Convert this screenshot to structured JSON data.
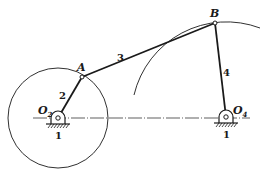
{
  "diagram": {
    "type": "four-bar linkage",
    "colors": {
      "ink": "#1a1a1a",
      "background": "#ffffff"
    },
    "points": {
      "O2": {
        "label": "O",
        "subscript": "2",
        "x": 58,
        "y": 118
      },
      "A": {
        "label": "A",
        "x": 82,
        "y": 77
      },
      "B": {
        "label": "B",
        "x": 215,
        "y": 23
      },
      "O4": {
        "label": "O",
        "subscript": "4",
        "x": 226,
        "y": 117
      }
    },
    "links": [
      {
        "id": "2",
        "label": "2",
        "from": "O2",
        "to": "A"
      },
      {
        "id": "3",
        "label": "3",
        "from": "A",
        "to": "B"
      },
      {
        "id": "4",
        "label": "4",
        "from": "B",
        "to": "O4"
      }
    ],
    "ground_labels": [
      "1",
      "1"
    ],
    "circle_O2": {
      "cx": 58,
      "cy": 118,
      "r": 50
    },
    "arc_O4": {
      "cx": 226,
      "cy": 117,
      "r": 95
    },
    "centerline": {
      "x1": 33,
      "x2": 250,
      "y": 118
    }
  }
}
